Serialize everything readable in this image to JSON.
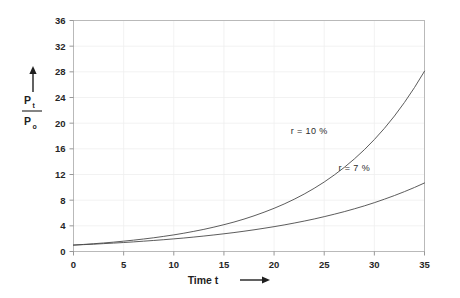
{
  "chart_data": {
    "type": "line",
    "title": "",
    "xlabel": "Time t",
    "ylabel": "Pt / Po",
    "ylabel_numerator": "P",
    "ylabel_numerator_sub": "t",
    "ylabel_denominator": "P",
    "ylabel_denominator_sub": "o",
    "xlabel_arrow": "right-arrow",
    "ylabel_arrow": "up-arrow",
    "xlim": [
      0,
      35
    ],
    "ylim": [
      0,
      36
    ],
    "xticks": [
      0,
      5,
      10,
      15,
      20,
      25,
      30,
      35
    ],
    "yticks": [
      0,
      4,
      8,
      12,
      16,
      20,
      24,
      28,
      32,
      36
    ],
    "xtick_labels": [
      "0",
      "5",
      "10",
      "15",
      "20",
      "25",
      "30",
      "35"
    ],
    "ytick_labels": [
      "0",
      "4",
      "8",
      "12",
      "16",
      "20",
      "24",
      "28",
      "32",
      "36"
    ],
    "grid": true,
    "legend_position": "inline-annotation",
    "series": [
      {
        "name": "r = 10 %",
        "label": "r = 10 %",
        "rate": 0.1,
        "color": "#4a4a4a",
        "label_x": 23.5,
        "label_y": 18.3,
        "x": [
          0,
          1,
          2,
          3,
          4,
          5,
          6,
          7,
          8,
          9,
          10,
          11,
          12,
          13,
          14,
          15,
          16,
          17,
          18,
          19,
          20,
          21,
          22,
          23,
          24,
          25,
          26,
          27,
          28,
          29,
          30,
          31,
          32,
          33,
          34,
          35
        ],
        "values": [
          1.0,
          1.1,
          1.21,
          1.33,
          1.46,
          1.61,
          1.77,
          1.95,
          2.14,
          2.36,
          2.59,
          2.85,
          3.14,
          3.45,
          3.8,
          4.18,
          4.59,
          5.05,
          5.56,
          6.12,
          6.73,
          7.4,
          8.14,
          8.95,
          9.85,
          10.83,
          11.92,
          13.11,
          14.42,
          15.86,
          17.45,
          19.19,
          21.11,
          23.23,
          25.55,
          28.1
        ]
      },
      {
        "name": "r = 7 %",
        "label": "r = 7 %",
        "rate": 0.07,
        "color": "#4a4a4a",
        "label_x": 28.0,
        "label_y": 12.6,
        "x": [
          0,
          1,
          2,
          3,
          4,
          5,
          6,
          7,
          8,
          9,
          10,
          11,
          12,
          13,
          14,
          15,
          16,
          17,
          18,
          19,
          20,
          21,
          22,
          23,
          24,
          25,
          26,
          27,
          28,
          29,
          30,
          31,
          32,
          33,
          34,
          35
        ],
        "values": [
          1.0,
          1.07,
          1.14,
          1.23,
          1.31,
          1.4,
          1.5,
          1.61,
          1.72,
          1.84,
          1.97,
          2.1,
          2.25,
          2.41,
          2.58,
          2.76,
          2.95,
          3.16,
          3.38,
          3.62,
          3.87,
          4.14,
          4.43,
          4.74,
          5.07,
          5.43,
          5.81,
          6.21,
          6.65,
          7.11,
          7.61,
          8.15,
          8.72,
          9.33,
          9.98,
          10.68
        ]
      }
    ]
  }
}
